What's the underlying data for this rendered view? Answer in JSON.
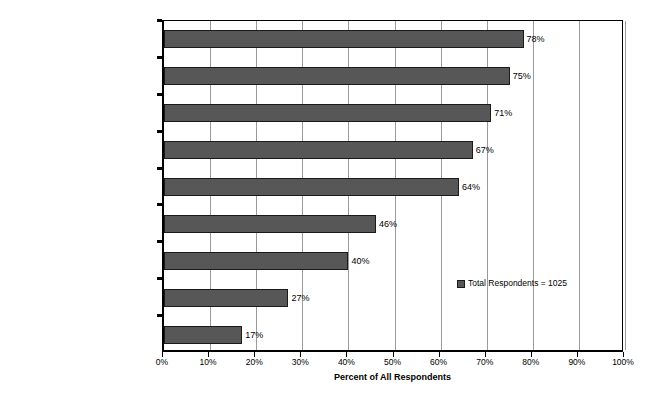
{
  "chart_data": {
    "type": "bar",
    "orientation": "horizontal",
    "title": "",
    "subtitle": "",
    "xlabel": "Percent of All Respondents",
    "ylabel": "",
    "xlim": [
      0,
      100
    ],
    "xticks": [
      "0%",
      "10%",
      "20%",
      "30%",
      "40%",
      "50%",
      "60%",
      "70%",
      "80%",
      "90%",
      "100%"
    ],
    "xtick_values": [
      0,
      10,
      20,
      30,
      40,
      50,
      60,
      70,
      80,
      90,
      100
    ],
    "grid": "vertical",
    "legend_position": "inside-right",
    "categories": [
      "Decrease in Cycle-Time",
      "Decrease in Mfg. Cost",
      "Increase in Product Line",
      "Increase in ROI",
      "Increase in Mkt. Share",
      "Focused Production",
      "Progress Towards Zero Defects",
      "Mixed Model Lines",
      "Progress Towards Zero Inventory"
    ],
    "values": [
      78,
      75,
      71,
      67,
      64,
      46,
      40,
      27,
      17
    ],
    "data_labels": [
      "78%",
      "75%",
      "71%",
      "67%",
      "64%",
      "46%",
      "40%",
      "27%",
      "17%"
    ],
    "series": [
      {
        "name": "Total Respondents = 1025",
        "values": [
          78,
          75,
          71,
          67,
          64,
          46,
          40,
          27,
          17
        ],
        "color": "#575757"
      }
    ],
    "legend": [
      {
        "label": "Total Respondents = 1025",
        "color": "#575757"
      }
    ],
    "colors": {
      "bar_fill": "#575757",
      "bar_border": "#1a1a1a",
      "gridline": "#9a9a9a",
      "axis": "#000000",
      "background": "#ffffff",
      "text": "#000000"
    }
  }
}
